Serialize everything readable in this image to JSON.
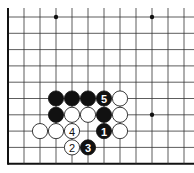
{
  "diagram": {
    "type": "go-board-fragment",
    "grid": {
      "columns_visible": 12,
      "rows_visible": 10,
      "origin_x": 8,
      "origin_y": 17,
      "spacing_x": 16,
      "spacing_y": 16.3,
      "edges": [
        "left",
        "bottom"
      ]
    },
    "star_points": [
      {
        "col": 3,
        "row": 0
      },
      {
        "col": 9,
        "row": 0
      },
      {
        "col": 9,
        "row": 6
      }
    ],
    "stones": [
      {
        "color": "black",
        "col": 3,
        "row": 5,
        "label": ""
      },
      {
        "color": "black",
        "col": 4,
        "row": 5,
        "label": ""
      },
      {
        "color": "black",
        "col": 5,
        "row": 5,
        "label": ""
      },
      {
        "color": "black",
        "col": 6,
        "row": 5,
        "label": "5"
      },
      {
        "color": "white",
        "col": 7,
        "row": 5,
        "label": ""
      },
      {
        "color": "black",
        "col": 3,
        "row": 6,
        "label": ""
      },
      {
        "color": "white",
        "col": 4,
        "row": 6,
        "label": ""
      },
      {
        "color": "white",
        "col": 5,
        "row": 6,
        "label": ""
      },
      {
        "color": "black",
        "col": 6,
        "row": 6,
        "label": ""
      },
      {
        "color": "white",
        "col": 7,
        "row": 6,
        "label": ""
      },
      {
        "color": "white",
        "col": 2,
        "row": 7,
        "label": ""
      },
      {
        "color": "white",
        "col": 3,
        "row": 7,
        "label": ""
      },
      {
        "color": "white",
        "col": 4,
        "row": 7,
        "label": "4"
      },
      {
        "color": "black",
        "col": 6,
        "row": 7,
        "label": "1"
      },
      {
        "color": "white",
        "col": 7,
        "row": 7,
        "label": ""
      },
      {
        "color": "white",
        "col": 4,
        "row": 8,
        "label": "2"
      },
      {
        "color": "black",
        "col": 5,
        "row": 8,
        "label": "3"
      }
    ],
    "colors": {
      "board": "#ffffff",
      "lines": "#333333",
      "black_stone": "#111111",
      "white_stone": "#ffffff"
    }
  }
}
